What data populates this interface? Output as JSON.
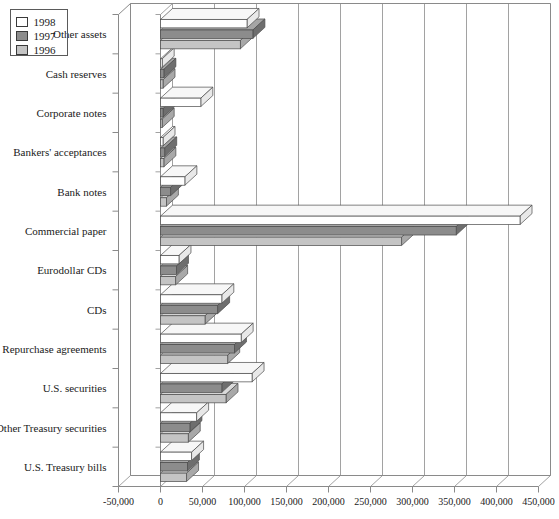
{
  "chart_data": {
    "type": "bar",
    "orientation": "horizontal",
    "title": "",
    "xlabel": "",
    "ylabel": "",
    "xlim": [
      -50000,
      450000
    ],
    "xticks": [
      -50000,
      0,
      50000,
      100000,
      150000,
      200000,
      250000,
      300000,
      350000,
      400000,
      450000
    ],
    "xtick_labels": [
      "-50,000",
      "0",
      "50,000",
      "100,000",
      "150,000",
      "200,000",
      "250,000",
      "300,000",
      "350,000",
      "400,000",
      "450,000"
    ],
    "grid": true,
    "legend_position": "top-left",
    "categories": [
      "Other assets",
      "Cash reserves",
      "Corporate notes",
      "Bankers' acceptances",
      "Bank notes",
      "Commercial paper",
      "Eurodollar CDs",
      "CDs",
      "Repurchase agreements",
      "U.S. securities",
      "Other Treasury securities",
      "U.S. Treasury bills"
    ],
    "series": [
      {
        "name": "1998",
        "color": "#ffffff",
        "values": [
          103000,
          2000,
          48000,
          3000,
          29000,
          428000,
          22000,
          73000,
          96000,
          109000,
          43000,
          37000
        ]
      },
      {
        "name": "1997",
        "color": "#8c8c8c",
        "values": [
          110000,
          4000,
          3000,
          5000,
          12000,
          352000,
          19000,
          68000,
          88000,
          73000,
          35000,
          32000
        ]
      },
      {
        "name": "1996",
        "color": "#c4c4c4",
        "values": [
          95000,
          3000,
          2000,
          4000,
          7000,
          287000,
          18000,
          53000,
          80000,
          78000,
          33000,
          31000
        ]
      }
    ]
  },
  "legend": {
    "items": [
      {
        "label": "1998",
        "color": "#ffffff"
      },
      {
        "label": "1997",
        "color": "#8c8c8c"
      },
      {
        "label": "1996",
        "color": "#c4c4c4"
      }
    ]
  },
  "colors": {
    "axis": "#8a8a8a",
    "grid": "#8a8a8a",
    "bar_outline": "#4a4a4a",
    "text": "#1a1a1a",
    "series_1998": "#ffffff",
    "series_1997": "#8c8c8c",
    "series_1996": "#c4c4c4",
    "side_1998": "#e8e8e8",
    "top_1998": "#f7f7f7",
    "side_1997": "#6e6e6e",
    "top_1997": "#a5a5a5",
    "side_1996": "#a8a8a8",
    "top_1996": "#dadada"
  }
}
